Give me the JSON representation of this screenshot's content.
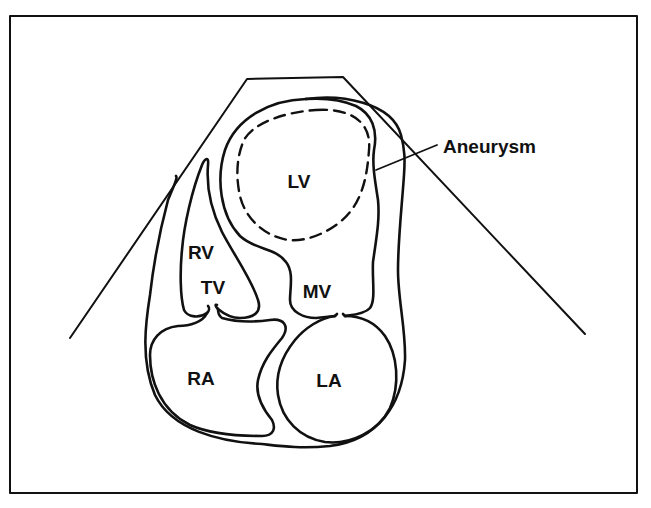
{
  "figure": {
    "type": "echocardiogram-schematic",
    "view": "apical four-chamber",
    "stroke_color": "#111111",
    "background": "#ffffff"
  },
  "labels": {
    "lv": {
      "text": "LV",
      "x": 299,
      "y": 181
    },
    "rv": {
      "text": "RV",
      "x": 201,
      "y": 252
    },
    "tv": {
      "text": "TV",
      "x": 213,
      "y": 287
    },
    "mv": {
      "text": "MV",
      "x": 317,
      "y": 291
    },
    "ra": {
      "text": "RA",
      "x": 201,
      "y": 378
    },
    "la": {
      "text": "LA",
      "x": 329,
      "y": 380
    },
    "aneurysm": {
      "text": "Aneurysm",
      "x": 445,
      "y": 145
    }
  }
}
